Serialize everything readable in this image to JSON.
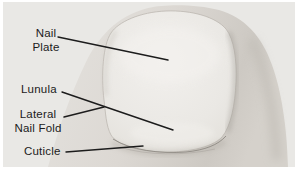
{
  "figure": {
    "kind": "labeled black-and-white photograph of a fingernail (nail anatomy)",
    "annotations": {
      "nail_plate": {
        "line1": "Nail",
        "line2": "Plate"
      },
      "lunula": {
        "label": "Lunula"
      },
      "lateral_nail_fold": {
        "line1": "Lateral",
        "line2": "Nail Fold"
      },
      "cuticle": {
        "label": "Cuticle"
      }
    },
    "colors": {
      "page_background": "#ffffff",
      "photo_background": "#e9e8e5",
      "skin_tone": "#dcd8d3",
      "nail_plate": "#edebe7",
      "annotation_text": "#1b1b1b",
      "pointer_line": "#1c1c1c"
    }
  }
}
